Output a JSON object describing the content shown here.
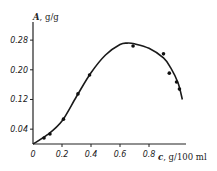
{
  "chart_data": {
    "type": "line",
    "title": "",
    "xlabel": "c, g/100 ml",
    "ylabel": "A, g/g",
    "x_symbol": "c",
    "x_unit": "g/100 ml",
    "y_symbol": "A",
    "y_unit": "g/g",
    "xlim": [
      0,
      1.05
    ],
    "ylim": [
      0,
      0.3
    ],
    "x_ticks": [
      0,
      0.2,
      0.4,
      0.6,
      0.8
    ],
    "x_tick_labels": [
      "0",
      "0.2",
      "0.4",
      "0.6",
      "0.8"
    ],
    "y_ticks": [
      0.04,
      0.12,
      0.2,
      0.28
    ],
    "y_tick_labels": [
      "0.04",
      "0.12",
      "0.20",
      "0.28"
    ],
    "grid": false,
    "legend": null,
    "series": [
      {
        "name": "experimental points",
        "kind": "scatter",
        "x": [
          0.076,
          0.117,
          0.21,
          0.31,
          0.39,
          0.69,
          0.9,
          0.94,
          0.99,
          1.01
        ],
        "y": [
          0.016,
          0.027,
          0.067,
          0.135,
          0.186,
          0.264,
          0.243,
          0.191,
          0.167,
          0.148
        ]
      },
      {
        "name": "fitted curve",
        "kind": "line",
        "x": [
          0,
          0.1,
          0.2,
          0.3,
          0.4,
          0.5,
          0.6,
          0.65,
          0.7,
          0.8,
          0.9,
          0.95,
          1.0,
          1.03
        ],
        "y": [
          0,
          0.025,
          0.062,
          0.128,
          0.192,
          0.24,
          0.268,
          0.272,
          0.27,
          0.258,
          0.232,
          0.205,
          0.165,
          0.12
        ]
      }
    ]
  }
}
